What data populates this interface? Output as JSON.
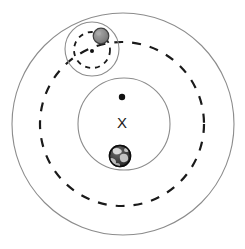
{
  "diagram": {
    "background_color": "#ffffff",
    "center": {
      "x": 123,
      "y": 124
    },
    "elements": {
      "outer_orbit_circle": {
        "name": "outer-solid-orbit",
        "style": "solid",
        "cx": 123,
        "cy": 124,
        "r": 111,
        "stroke": "#8c8c8c",
        "stroke_width": 1.1
      },
      "dashed_orbit_circle": {
        "name": "moon-orbit-dashed",
        "style": "dashed",
        "cx": 122,
        "cy": 124,
        "r": 82,
        "stroke": "#1a1a1a",
        "stroke_width": 2.2,
        "dash_pattern": "9 9"
      },
      "earth_circle": {
        "name": "earth-wobble-circle",
        "style": "solid",
        "cx": 124,
        "cy": 124,
        "r": 46,
        "stroke": "#8c8c8c",
        "stroke_width": 1.1
      },
      "moon_circle": {
        "name": "moon-wobble-circle",
        "style": "solid",
        "cx": 92,
        "cy": 49,
        "r": 27,
        "stroke": "#8c8c8c",
        "stroke_width": 1.1
      },
      "moon_inner_dashed_circle": {
        "name": "moon-inner-dashed-circle",
        "style": "dashed",
        "cx": 92,
        "cy": 50,
        "r": 18,
        "stroke": "#1a1a1a",
        "stroke_width": 1.8,
        "dash_pattern": "5 5"
      },
      "earth_center_dot": {
        "name": "earth-center-dot",
        "cx": 122,
        "cy": 97,
        "r": 3.2,
        "fill": "#111111"
      },
      "moon_center_dot": {
        "name": "moon-center-dot",
        "cx": 92,
        "cy": 51,
        "r": 2.0,
        "fill": "#111111"
      },
      "barycenter_marker": {
        "name": "barycenter-x-marker",
        "label": "X",
        "cx": 122,
        "cy": 124,
        "color": "#1a1a1a"
      },
      "earth_globe": {
        "name": "earth-globe",
        "cx": 120,
        "cy": 156,
        "r": 11,
        "ocean_color": "#3a3a3a",
        "land_color": "#d8d8d8",
        "outline": "#111111"
      },
      "moon_sphere": {
        "name": "moon-sphere",
        "cx": 101,
        "cy": 36,
        "r": 8,
        "fill": "#858585",
        "highlight": "#a3a3a3",
        "outline": "#3f3f3f"
      }
    }
  }
}
